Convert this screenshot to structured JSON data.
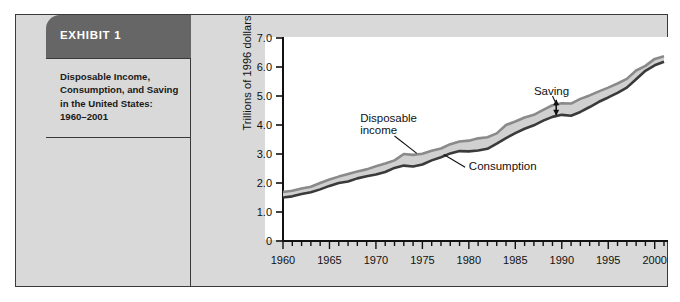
{
  "exhibit": {
    "header_label": "EXHIBIT 1",
    "caption_lines": [
      "Disposable Income,",
      "Consumption, and Saving",
      "in the United States:",
      "1960–2001"
    ]
  },
  "chart_data": {
    "type": "area",
    "title": "",
    "xlabel": "",
    "ylabel": "Trillions of 1996 dollars",
    "xlim": [
      1960,
      2001
    ],
    "ylim": [
      0,
      7.0
    ],
    "ytick_labels": [
      "7.0",
      "6.0",
      "5.0",
      "4.0",
      "3.0",
      "2.0",
      "1.0",
      "0"
    ],
    "ytick_values": [
      7.0,
      6.0,
      5.0,
      4.0,
      3.0,
      2.0,
      1.0,
      0
    ],
    "xtick_labels": [
      "1960",
      "1965",
      "1970",
      "1975",
      "1980",
      "1985",
      "1990",
      "1995",
      "2000"
    ],
    "xtick_values": [
      1960,
      1965,
      1970,
      1975,
      1980,
      1985,
      1990,
      1995,
      2000
    ],
    "minor_tick_interval": 1,
    "grid": false,
    "legend": "inline-annotations",
    "annotations": [
      {
        "name": "saving",
        "text": "Saving",
        "x": 1987.0,
        "y": 5.05
      },
      {
        "name": "disposable-income",
        "text": "Disposable",
        "x": 1968.3,
        "y": 4.12
      },
      {
        "name": "disposable-income-2",
        "text": "income",
        "x": 1968.3,
        "y": 3.7
      },
      {
        "name": "consumption",
        "text": "Consumption",
        "x": 1980.0,
        "y": 2.45
      }
    ],
    "x": [
      1960,
      1961,
      1962,
      1963,
      1964,
      1965,
      1966,
      1967,
      1968,
      1969,
      1970,
      1971,
      1972,
      1973,
      1974,
      1975,
      1976,
      1977,
      1978,
      1979,
      1980,
      1981,
      1982,
      1983,
      1984,
      1985,
      1986,
      1987,
      1988,
      1989,
      1990,
      1991,
      1992,
      1993,
      1994,
      1995,
      1996,
      1997,
      1998,
      1999,
      2000,
      2001
    ],
    "series": [
      {
        "name": "Disposable income",
        "color": "#8a8a8a",
        "values": [
          1.69,
          1.73,
          1.81,
          1.87,
          2.0,
          2.12,
          2.22,
          2.31,
          2.4,
          2.47,
          2.58,
          2.67,
          2.78,
          3.0,
          2.97,
          3.01,
          3.11,
          3.19,
          3.34,
          3.43,
          3.46,
          3.54,
          3.58,
          3.71,
          4.0,
          4.12,
          4.26,
          4.35,
          4.52,
          4.68,
          4.75,
          4.74,
          4.9,
          5.02,
          5.16,
          5.29,
          5.43,
          5.59,
          5.88,
          6.04,
          6.28,
          6.37
        ]
      },
      {
        "name": "Consumption",
        "color": "#3a3a3a",
        "values": [
          1.5,
          1.54,
          1.62,
          1.68,
          1.78,
          1.9,
          2.0,
          2.05,
          2.16,
          2.23,
          2.29,
          2.38,
          2.52,
          2.6,
          2.57,
          2.64,
          2.78,
          2.89,
          3.02,
          3.1,
          3.09,
          3.12,
          3.18,
          3.36,
          3.55,
          3.72,
          3.87,
          3.99,
          4.15,
          4.28,
          4.35,
          4.32,
          4.45,
          4.62,
          4.8,
          4.95,
          5.11,
          5.29,
          5.58,
          5.87,
          6.06,
          6.18
        ]
      }
    ],
    "saving_marker": {
      "name": "saving-gap-arrow",
      "x": 1989.4,
      "y_low": 4.35,
      "y_high": 4.85
    }
  }
}
